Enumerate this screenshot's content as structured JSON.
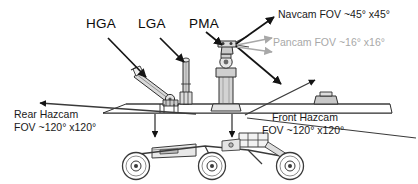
{
  "figure": {
    "background_color": "#ffffff"
  },
  "colors": {
    "ink": "#111111",
    "gray_annotation": "#a8a8a8",
    "rover_outline": "#3a3a3a",
    "rover_fill": "#d9d9d9"
  },
  "part_labels": [
    {
      "id": "hga",
      "text": "HGA"
    },
    {
      "id": "lga",
      "text": "LGA"
    },
    {
      "id": "pma",
      "text": "PMA"
    }
  ],
  "fov_labels": [
    {
      "id": "navcam",
      "line1": "Navcam FOV ~45° x45°",
      "color": "#1a1a1a"
    },
    {
      "id": "pancam",
      "line1": "Pancam FOV ~16° x16°",
      "color": "#a8a8a8"
    },
    {
      "id": "rear_hazcam",
      "line1": "Rear Hazcam",
      "line2": "FOV ~120° x120°",
      "color": "#1a1a1a"
    },
    {
      "id": "front_hazcam",
      "line1": "Front Hazcam",
      "line2": "FOV ~120° x120°",
      "color": "#1a1a1a"
    }
  ]
}
